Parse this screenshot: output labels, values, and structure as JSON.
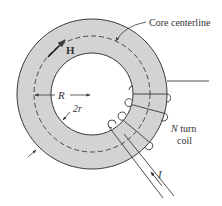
{
  "figure": {
    "type": "toroidal core with N-turn coil",
    "colors": {
      "core_fill": "#d3d3d3",
      "line": "#3a3a3a",
      "background": "#ffffff"
    },
    "labels": {
      "core_centerline": "Core centerline",
      "field": "H",
      "radius": "R",
      "thickness": "2r",
      "turns_symbol": "N",
      "turns_text": " turn",
      "coil": "coil",
      "current": "I"
    }
  }
}
